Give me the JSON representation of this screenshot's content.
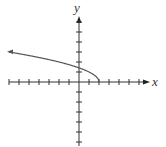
{
  "chart_data": {
    "type": "line",
    "title": "",
    "xlabel": "x",
    "ylabel": "y",
    "function": "y = sqrt(2 - x)",
    "x": [
      -7,
      -6,
      -5,
      -4,
      -3,
      -2,
      -1,
      0,
      1,
      2
    ],
    "values": [
      3.0,
      2.83,
      2.65,
      2.45,
      2.24,
      2.0,
      1.73,
      1.41,
      1.0,
      0.0
    ],
    "xlim": [
      -7,
      7
    ],
    "ylim": [
      -6,
      7
    ],
    "grid": false,
    "left_end_arrow": true,
    "color": "#555555"
  },
  "axes": {
    "x_label": "x",
    "y_label": "y"
  }
}
